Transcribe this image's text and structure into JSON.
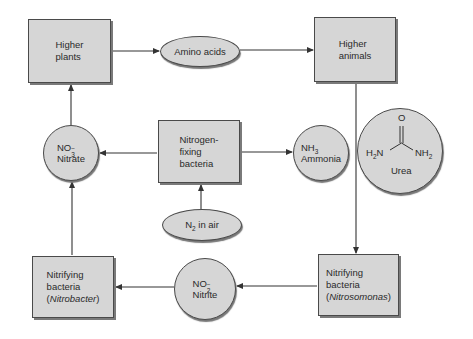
{
  "diagram": {
    "nodes": {
      "higher_plants": {
        "line1": "Higher",
        "line2": "plants"
      },
      "amino_acids": {
        "label": "Amino acids"
      },
      "higher_animals": {
        "line1": "Higher",
        "line2": "animals"
      },
      "nitrate": {
        "formula_base": "NO",
        "formula_sub": "3",
        "formula_sup": "−",
        "label": "Nitrate"
      },
      "nitrogen_fixing": {
        "line1": "Nitrogen-",
        "line2": "fixing",
        "line3": "bacteria"
      },
      "ammonia": {
        "formula_base": "NH",
        "formula_sub": "3",
        "label": "Ammonia"
      },
      "urea": {
        "o": "O",
        "left": "H",
        "left_sub": "2",
        "left_n": "N",
        "right": "NH",
        "right_sub": "2",
        "label": "Urea"
      },
      "n2_air": {
        "base": "N",
        "sub": "2",
        "rest": " in air"
      },
      "nitrobacter": {
        "line1": "Nitrifying",
        "line2": "bacteria",
        "open": "(",
        "genus": "Nitrobacter",
        "close": ")"
      },
      "nitrite": {
        "formula_base": "NO",
        "formula_sub": "2",
        "formula_sup": "−",
        "label": "Nitrite"
      },
      "nitrosomonas": {
        "line1": "Nitrifying",
        "line2": "bacteria",
        "open": "(",
        "genus": "Nitrosomonas",
        "close": ")"
      }
    },
    "edges": [
      {
        "from": "Higher plants",
        "to": "Amino acids"
      },
      {
        "from": "Amino acids",
        "to": "Higher animals"
      },
      {
        "from": "Higher animals",
        "to": "Nitrosomonas"
      },
      {
        "from": "Nitrogen-fixing bacteria",
        "to": "Nitrate"
      },
      {
        "from": "Nitrogen-fixing bacteria",
        "to": "Ammonia"
      },
      {
        "from": "N2 in air",
        "to": "Nitrogen-fixing bacteria"
      },
      {
        "from": "Nitrosomonas",
        "to": "Nitrite"
      },
      {
        "from": "Nitrite",
        "to": "Nitrobacter"
      },
      {
        "from": "Nitrobacter",
        "to": "Nitrate"
      },
      {
        "from": "Nitrate",
        "to": "Higher plants"
      }
    ],
    "colors": {
      "fill": "#d6d6d6",
      "stroke": "#4a4a4a",
      "background": "#ffffff"
    }
  }
}
